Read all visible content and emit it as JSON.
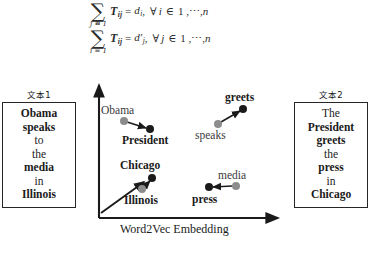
{
  "figure": {
    "title_axis": "Word2Vec Embedding"
  },
  "equations": [
    {
      "id": "eq1",
      "sum_upper": "n",
      "sum_lower": "j = 1",
      "matrix": "T",
      "matrix_sub": "ij",
      "equals": "=",
      "rhs": "d",
      "rhs_sub": "i",
      "forall": "∀",
      "index": "i",
      "member": "∈",
      "range": "1 ,",
      "dots": "⋯",
      "comma": ",",
      "n": "n"
    },
    {
      "id": "eq2",
      "sum_upper": "n",
      "sum_lower": "i = 1",
      "matrix": "T",
      "matrix_sub": "ij",
      "equals": "=",
      "rhs": "d′",
      "rhs_sub": "j",
      "forall": "∀",
      "index": "j",
      "member": "∈",
      "range": "1 ,",
      "dots": "⋯",
      "comma": ",",
      "n": "n"
    }
  ],
  "text_boxes": {
    "left": {
      "caption": "文本1",
      "words": [
        {
          "text": "Obama",
          "bold": true
        },
        {
          "text": "speaks",
          "bold": true
        },
        {
          "text": "to",
          "bold": false
        },
        {
          "text": "the",
          "bold": false
        },
        {
          "text": "media",
          "bold": true
        },
        {
          "text": "in",
          "bold": false
        },
        {
          "text": "Illinois",
          "bold": true
        }
      ]
    },
    "right": {
      "caption": "文本2",
      "words": [
        {
          "text": "The",
          "bold": false
        },
        {
          "text": "President",
          "bold": true
        },
        {
          "text": "greets",
          "bold": true
        },
        {
          "text": "the",
          "bold": false
        },
        {
          "text": "press",
          "bold": true
        },
        {
          "text": "in",
          "bold": false
        },
        {
          "text": "Chicago",
          "bold": true
        }
      ]
    }
  },
  "chart_data": {
    "type": "scatter",
    "title": "",
    "xlabel": "Word2Vec Embedding",
    "ylabel": "",
    "grid": false,
    "legend": null,
    "axis_origin_px": [
      99,
      218
    ],
    "axis_x_end_px": [
      278,
      218
    ],
    "axis_y_end_px": [
      99,
      85
    ],
    "colors": {
      "source_point": "#8c8c8c",
      "target_point": "#1a1a1a",
      "arrow": "#1a1a1a",
      "axis": "#1a1a1a"
    },
    "points": [
      {
        "word": "Obama",
        "role": "source",
        "color": "#8c8c8c",
        "x_px": 124,
        "y_px": 121,
        "label_dx": -23,
        "label_dy": -17,
        "bold": false
      },
      {
        "word": "President",
        "role": "target",
        "color": "#1a1a1a",
        "x_px": 150,
        "y_px": 129,
        "label_dx": -28,
        "label_dy": 5,
        "bold": true
      },
      {
        "word": "speaks",
        "role": "source",
        "color": "#8c8c8c",
        "x_px": 218,
        "y_px": 124,
        "label_dx": -23,
        "label_dy": 5,
        "bold": false
      },
      {
        "word": "greets",
        "role": "target",
        "color": "#1a1a1a",
        "x_px": 243,
        "y_px": 109,
        "label_dx": -18,
        "label_dy": -18,
        "bold": true
      },
      {
        "word": "Illinois",
        "role": "source",
        "color": "#8c8c8c",
        "x_px": 142,
        "y_px": 189,
        "label_dx": -18,
        "label_dy": 5,
        "bold": true
      },
      {
        "word": "Chicago",
        "role": "target",
        "color": "#1a1a1a",
        "x_px": 152,
        "y_px": 178,
        "label_dx": -32,
        "label_dy": -19,
        "bold": true
      },
      {
        "word": "media",
        "role": "source",
        "color": "#8c8c8c",
        "x_px": 236,
        "y_px": 186,
        "label_dx": -18,
        "label_dy": -17,
        "bold": false
      },
      {
        "word": "press",
        "role": "target",
        "color": "#1a1a1a",
        "x_px": 209,
        "y_px": 187,
        "label_dx": -17,
        "label_dy": 6,
        "bold": true
      }
    ],
    "arrows": [
      {
        "from": "Obama",
        "to": "President",
        "x1": 127,
        "y1": 122,
        "x2": 146,
        "y2": 128
      },
      {
        "from": "speaks",
        "to": "greets",
        "x1": 221,
        "y1": 122,
        "x2": 240,
        "y2": 111
      },
      {
        "from": "Illinois",
        "to": "Chicago",
        "x1": 144,
        "y1": 187,
        "x2": 150,
        "y2": 181
      },
      {
        "from": "media",
        "to": "press",
        "x1": 232,
        "y1": 186,
        "x2": 213,
        "y2": 187
      },
      {
        "from": "origin",
        "to": "Chicago",
        "x1": 101,
        "y1": 213,
        "x2": 144,
        "y2": 182
      }
    ]
  }
}
